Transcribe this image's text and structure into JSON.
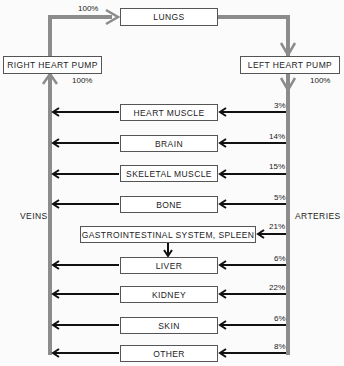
{
  "diagram": {
    "top": {
      "lungs": "LUNGS",
      "right_heart_pump": "RIGHT HEART PUMP",
      "left_heart_pump": "LEFT HEART PUMP",
      "lungs_inflow_pct": "100%",
      "right_pump_pct": "100%",
      "left_pump_pct": "100%"
    },
    "sides": {
      "veins": "VEINS",
      "arteries": "ARTERIES"
    },
    "organs": [
      {
        "label": "HEART MUSCLE",
        "pct": "3%"
      },
      {
        "label": "BRAIN",
        "pct": "14%"
      },
      {
        "label": "SKELETAL MUSCLE",
        "pct": "15%"
      },
      {
        "label": "BONE",
        "pct": "5%"
      },
      {
        "label": "GASTROINTESTINAL SYSTEM, SPLEEN",
        "pct": "21%"
      },
      {
        "label": "LIVER",
        "pct": "6%"
      },
      {
        "label": "KIDNEY",
        "pct": "22%"
      },
      {
        "label": "SKIN",
        "pct": "6%"
      },
      {
        "label": "OTHER",
        "pct": "8%"
      }
    ],
    "colors": {
      "trunk": "#8c8c8c",
      "branch": "#111111",
      "box_border": "#555555"
    }
  }
}
